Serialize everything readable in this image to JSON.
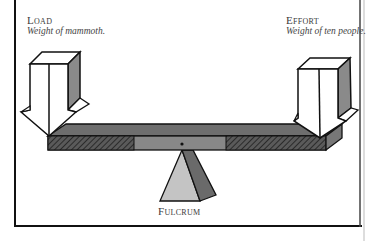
{
  "diagram": {
    "type": "lever",
    "load": {
      "title": "Load",
      "caption": "Weight of mammoth."
    },
    "effort": {
      "title": "Effort",
      "caption": "Weight of ten people."
    },
    "fulcrum": {
      "title": "Fulcrum"
    },
    "colors": {
      "line": "#111111",
      "beam_top": "#6e6e6e",
      "beam_front": "#888888",
      "hatch": "#3c3c3c",
      "arrow_side": "#8a8a8a",
      "fulcrum_light": "#c4c4c4",
      "fulcrum_dark": "#6a6a6a",
      "text": "#3a3a3a"
    }
  }
}
